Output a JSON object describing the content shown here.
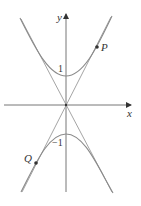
{
  "diagram": {
    "type": "hyperbola-with-asymptotes",
    "equation_hint": "y^2 - 4x^2 = 1 (upper and lower branches)",
    "axes": {
      "x_label": "x",
      "y_label": "y"
    },
    "tick_labels": {
      "upper_vertex": "1",
      "lower_vertex": "−1"
    },
    "points": [
      {
        "label": "P",
        "branch": "upper-right"
      },
      {
        "label": "Q",
        "branch": "lower-left"
      }
    ],
    "colors": {
      "axis": "#333333",
      "curve": "#888888",
      "asymptote": "#999999",
      "point": "#333333"
    }
  }
}
